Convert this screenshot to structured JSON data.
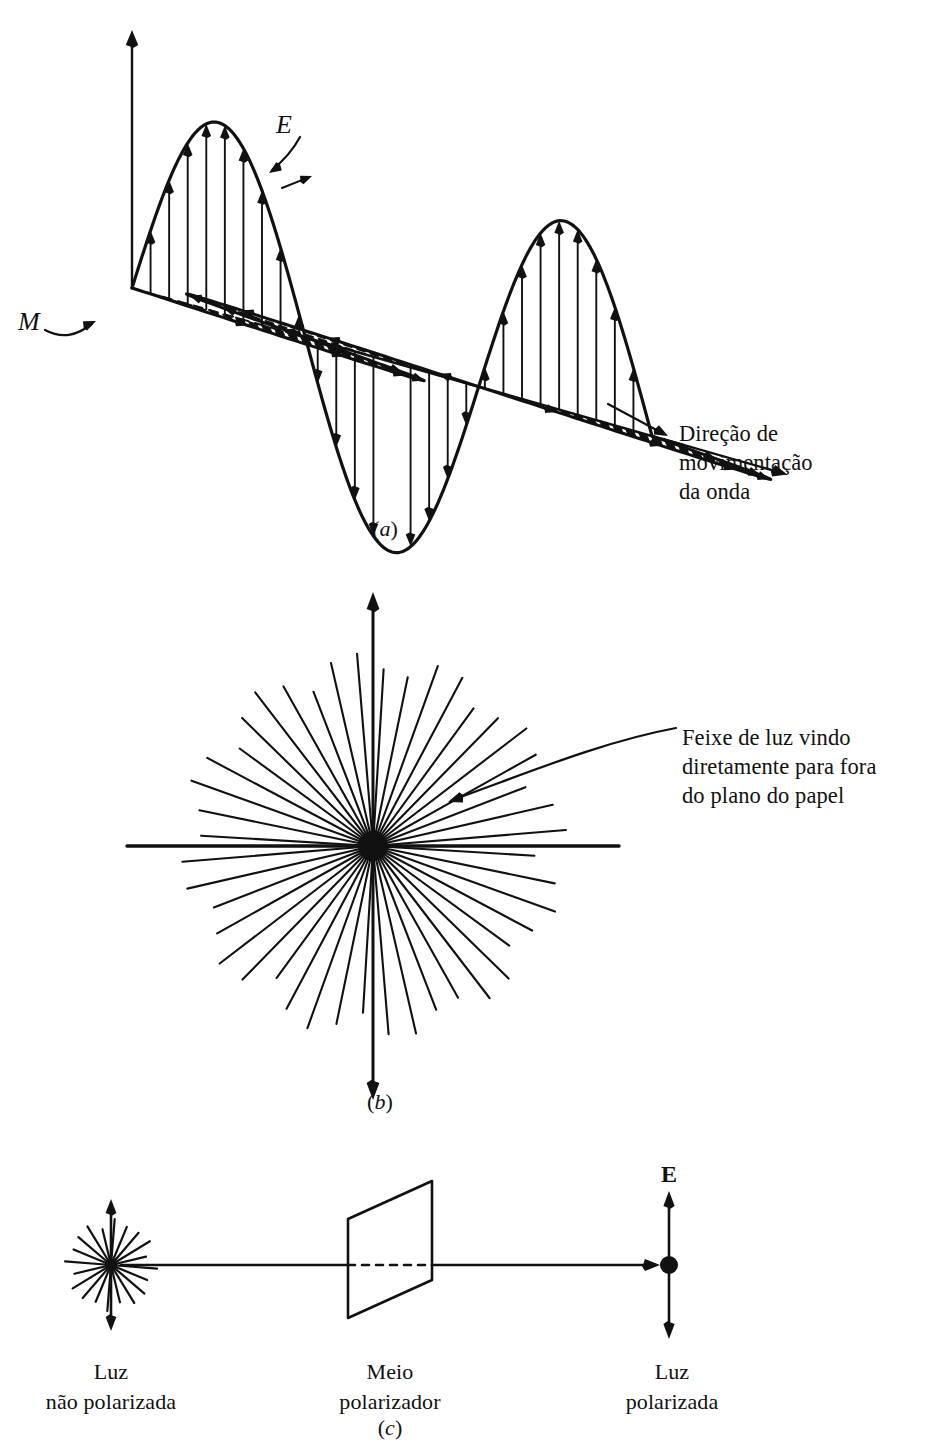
{
  "figure": {
    "background_color": "#ffffff",
    "ink_color": "#111111"
  },
  "panel_a": {
    "letter": "(a)",
    "letter_italic": "a",
    "field_label_e": "E",
    "field_label_m": "M",
    "direction_label_line1": "Direção de",
    "direction_label_line2": "movimentação",
    "direction_label_line3": "da onda",
    "geometry": {
      "origin_x": 132,
      "origin_y": 288,
      "axis_top_y": 30,
      "wave_length": 560,
      "amplitude": 190,
      "skew_dx": 520,
      "skew_dy": 148,
      "m_lobe_dx": 215,
      "m_lobe_dy": 72,
      "e_arrow_count": 13,
      "m_arrow_count": 9
    }
  },
  "panel_b": {
    "letter": "(b)",
    "letter_italic": "b",
    "callout_line1": "Feixe de luz vindo",
    "callout_line2": "diretamente para fora",
    "callout_line3": "do plano do papel",
    "geometry": {
      "center_x": 373,
      "center_y": 846,
      "ray_count": 44,
      "ray_radius": 188,
      "hub_radius": 15,
      "vertical_arrow_length": 254,
      "horizontal_line_length": 246
    }
  },
  "panel_c": {
    "letter": "(c)",
    "letter_italic": "c",
    "field_label_e": "E",
    "caption_left_line1": "Luz",
    "caption_left_line2": "não polarizada",
    "caption_mid_line1": "Meio",
    "caption_mid_line2": "polarizador",
    "caption_right_line1": "Luz",
    "caption_right_line2": "polarizada",
    "geometry": {
      "beam_y": 1265,
      "source_x": 111,
      "source_ray_count": 20,
      "source_ray_radius": 42,
      "source_arrow_length": 66,
      "polarizer_left_x": 348,
      "polarizer_right_x": 432,
      "polarizer_top_y": 1181,
      "polarizer_bottom_y": 1318,
      "polarizer_slant": 38,
      "dot_x": 669,
      "dot_radius": 9,
      "out_arrow_length": 74,
      "beam_end_x": 660
    }
  },
  "chart_data": {
    "type": "line",
    "series": [
      {
        "name": "E",
        "orientation": "vertical",
        "cycles": 1.5,
        "amplitude": 190,
        "samples_x": [
          0,
          0.125,
          0.25,
          0.375,
          0.5,
          0.625,
          0.75,
          0.875,
          1.0,
          1.125,
          1.25,
          1.375,
          1.5
        ],
        "samples_y": [
          0,
          0.707,
          1.0,
          0.707,
          0,
          -0.707,
          -1.0,
          -0.707,
          0,
          0.707,
          1.0,
          0.707,
          0
        ]
      },
      {
        "name": "M",
        "orientation": "horizontal-perspective",
        "cycles": 1.5,
        "amplitude": 190,
        "samples_x": [
          0,
          0.125,
          0.25,
          0.375,
          0.5,
          0.625,
          0.75,
          0.875,
          1.0,
          1.125,
          1.25,
          1.375,
          1.5
        ],
        "samples_y": [
          0,
          0.707,
          1.0,
          0.707,
          0,
          -0.707,
          -1.0,
          -0.707,
          0,
          0.707,
          1.0,
          0.707,
          0
        ]
      }
    ],
    "xlabel": "Direção de movimentação da onda",
    "ylabel": "E",
    "grid": false,
    "legend": [
      "E",
      "M"
    ]
  }
}
